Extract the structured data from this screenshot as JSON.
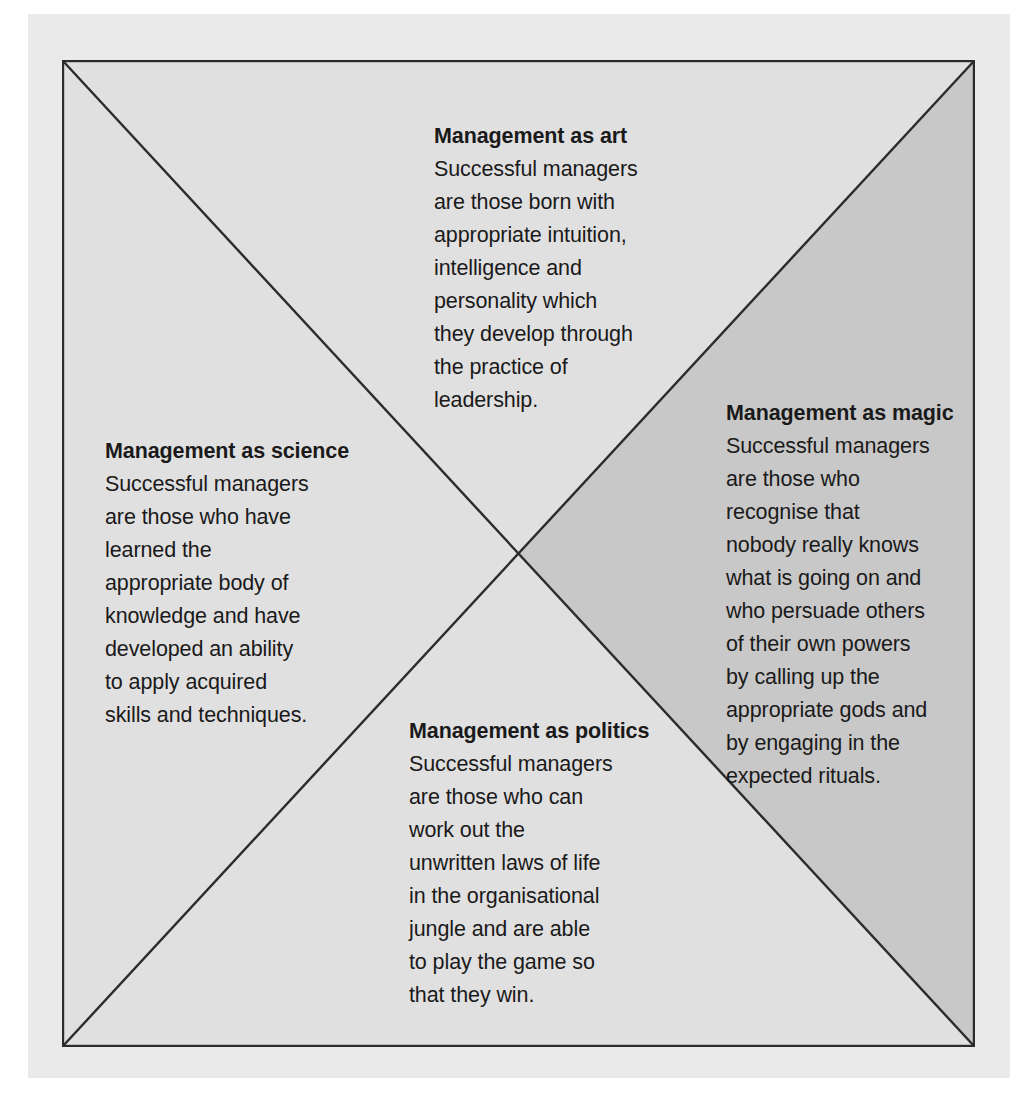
{
  "figure": {
    "shape": "square-with-diagonals",
    "quadrant_count": 4,
    "colors": {
      "page_background": "#ebeaea",
      "quadrant_light": "#e1e0e0",
      "quadrant_shaded": "#c9c8c8",
      "outline": "#2b2b2b",
      "text": "#1a1a1a"
    }
  },
  "blocks": {
    "art": {
      "heading": "Management as art",
      "body": "Successful managers\nare those born with\nappropriate intuition,\nintelligence and\npersonality which\nthey develop through\nthe practice of\nleadership.",
      "position": "top"
    },
    "magic": {
      "heading": "Management as magic",
      "body": "Successful managers\nare those who\nrecognise that\nnobody really knows\nwhat is going on and\nwho persuade others\nof their own powers\nby calling up the\nappropriate gods and\nby engaging in the\nexpected rituals.",
      "position": "right"
    },
    "science": {
      "heading": "Management as science",
      "body": "Successful managers\nare those who have\nlearned the\nappropriate body of\nknowledge and have\ndeveloped an ability\nto apply acquired\nskills and techniques.",
      "position": "left"
    },
    "politics": {
      "heading": "Management as politics",
      "body": "Successful managers\nare those who can\nwork out the\nunwritten laws of life\nin the organisational\njungle and are able\nto play the game so\nthat they win.",
      "position": "bottom"
    }
  }
}
